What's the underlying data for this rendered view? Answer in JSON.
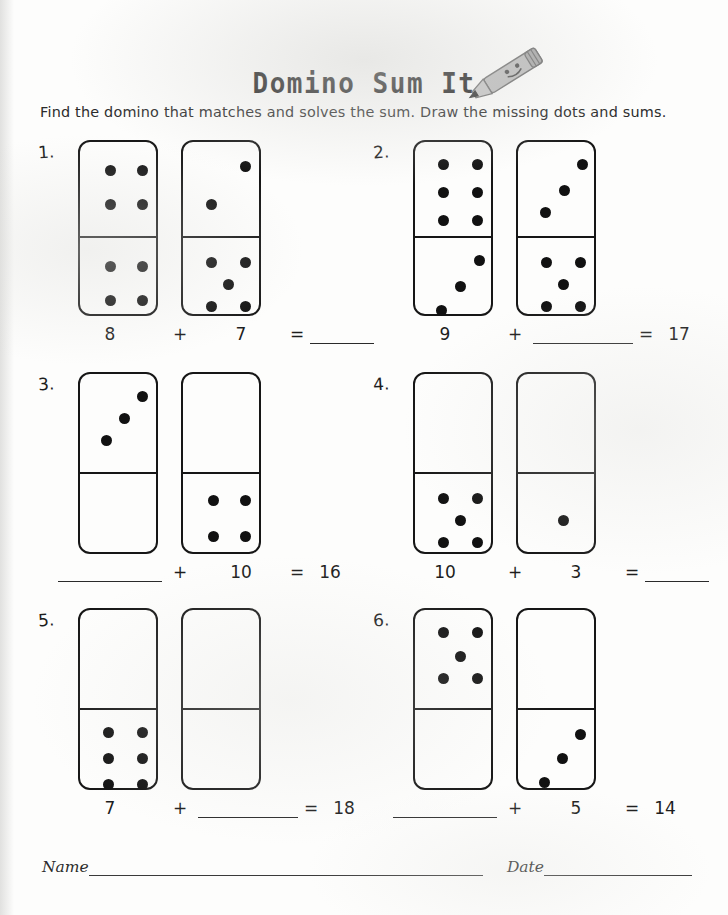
{
  "header": {
    "title": "Domino Sum It",
    "subtitle": "Find the domino that matches and solves the sum. Draw the missing dots and sums.",
    "pencil_icon": "pencil-icon"
  },
  "footer": {
    "name_label": "Name",
    "date_label": "Date"
  },
  "colors": {
    "ink": "#111111",
    "paper": "#fdfdfc",
    "pencil_body": "#b8b8b8",
    "pencil_tip": "#2a2a2a"
  },
  "worksheet": {
    "problems": [
      {
        "number": "1.",
        "left_domino": {
          "top_pips": [
            [
              30,
              28
            ],
            [
              62,
              28
            ],
            [
              30,
              62
            ],
            [
              62,
              62
            ]
          ],
          "bottom_pips": [
            [
              30,
              28
            ],
            [
              62,
              28
            ],
            [
              30,
              62
            ],
            [
              62,
              62
            ]
          ],
          "top_count": 4,
          "bottom_count": 4
        },
        "right_domino": {
          "top_pips": [
            [
              62,
              24
            ],
            [
              28,
              62
            ]
          ],
          "bottom_pips": [
            [
              28,
              24
            ],
            [
              62,
              24
            ],
            [
              45,
              46
            ],
            [
              28,
              68
            ],
            [
              62,
              68
            ]
          ],
          "top_count": 2,
          "bottom_count": 5
        },
        "equation": {
          "term1": "8",
          "operator": "+",
          "term2": "7",
          "equals": "=",
          "result": "",
          "term1_blank": false,
          "term2_blank": false,
          "result_blank": true
        }
      },
      {
        "number": "2.",
        "left_domino": {
          "top_pips": [
            [
              28,
              22
            ],
            [
              62,
              22
            ],
            [
              28,
              50
            ],
            [
              62,
              50
            ],
            [
              28,
              78
            ],
            [
              62,
              78
            ]
          ],
          "bottom_pips": [
            [
              64,
              22
            ],
            [
              45,
              48
            ],
            [
              26,
              72
            ]
          ],
          "top_count": 6,
          "bottom_count": 3
        },
        "right_domino": {
          "top_pips": [
            [
              64,
              22
            ],
            [
              46,
              48
            ],
            [
              27,
              70
            ]
          ],
          "bottom_pips": [
            [
              28,
              24
            ],
            [
              62,
              24
            ],
            [
              45,
              46
            ],
            [
              28,
              68
            ],
            [
              62,
              68
            ]
          ],
          "top_count": 3,
          "bottom_count": 5
        },
        "equation": {
          "term1": "9",
          "operator": "+",
          "term2": "",
          "equals": "=",
          "result": "17",
          "term1_blank": false,
          "term2_blank": true,
          "result_blank": false
        }
      },
      {
        "number": "3.",
        "left_domino": {
          "top_pips": [
            [
              62,
              22
            ],
            [
              44,
              44
            ],
            [
              26,
              66
            ]
          ],
          "bottom_pips": [],
          "top_count": 3,
          "bottom_count": 0
        },
        "right_domino": {
          "top_pips": [],
          "bottom_pips": [
            [
              30,
              26
            ],
            [
              62,
              26
            ],
            [
              30,
              62
            ],
            [
              62,
              62
            ]
          ],
          "top_count": 0,
          "bottom_count": 4
        },
        "equation": {
          "term1": "",
          "operator": "+",
          "term2": "10",
          "equals": "=",
          "result": "16",
          "term1_blank": true,
          "term2_blank": false,
          "result_blank": false
        }
      },
      {
        "number": "4.",
        "left_domino": {
          "top_pips": [],
          "bottom_pips": [
            [
              28,
              24
            ],
            [
              62,
              24
            ],
            [
              45,
              46
            ],
            [
              28,
              68
            ],
            [
              62,
              68
            ]
          ],
          "top_count": 0,
          "bottom_count": 5
        },
        "right_domino": {
          "top_pips": [],
          "bottom_pips": [
            [
              45,
              46
            ]
          ],
          "top_count": 0,
          "bottom_count": 1
        },
        "equation": {
          "term1": "10",
          "operator": "+",
          "term2": "3",
          "equals": "=",
          "result": "",
          "term1_blank": false,
          "term2_blank": false,
          "result_blank": true
        }
      },
      {
        "number": "5.",
        "left_domino": {
          "top_pips": [],
          "bottom_pips": [
            [
              28,
              22
            ],
            [
              62,
              22
            ],
            [
              28,
              48
            ],
            [
              62,
              48
            ],
            [
              28,
              74
            ],
            [
              62,
              74
            ]
          ],
          "top_count": 0,
          "bottom_count": 6
        },
        "right_domino": {
          "top_pips": [],
          "bottom_pips": [],
          "top_count": 0,
          "bottom_count": 0
        },
        "equation": {
          "term1": "7",
          "operator": "+",
          "term2": "",
          "equals": "=",
          "result": "18",
          "term1_blank": false,
          "term2_blank": true,
          "result_blank": false
        }
      },
      {
        "number": "6.",
        "left_domino": {
          "top_pips": [
            [
              28,
              22
            ],
            [
              62,
              22
            ],
            [
              45,
              46
            ],
            [
              28,
              68
            ],
            [
              62,
              68
            ]
          ],
          "bottom_pips": [],
          "top_count": 5,
          "bottom_count": 0
        },
        "right_domino": {
          "top_pips": [],
          "bottom_pips": [
            [
              62,
              24
            ],
            [
              44,
              48
            ],
            [
              26,
              72
            ]
          ],
          "top_count": 0,
          "bottom_count": 3
        },
        "equation": {
          "term1": "",
          "operator": "+",
          "term2": "5",
          "equals": "=",
          "result": "14",
          "term1_blank": true,
          "term2_blank": false,
          "result_blank": false
        }
      }
    ]
  }
}
